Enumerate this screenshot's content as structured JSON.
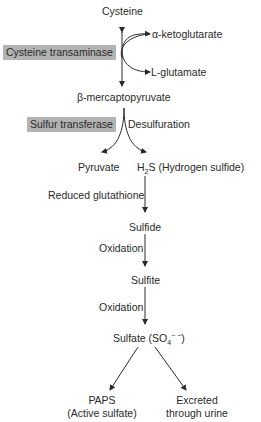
{
  "diagram": {
    "nodes": {
      "cysteine": "Cysteine",
      "alpha_ketoglutarate": "α-ketoglutarate",
      "l_glutamate": "L-glutamate",
      "beta_mercaptopyruvate": "β-mercaptopyruvate",
      "pyruvate": "Pyruvate",
      "h2s_prefix": "H",
      "h2s_sub": "2",
      "h2s_suffix": "S (Hydrogen sulfide)",
      "sulfide": "Sulfide",
      "sulfite": "Sulfite",
      "sulfate_prefix": "Sulfate (SO",
      "sulfate_sub": "4",
      "sulfate_sup": "− −",
      "sulfate_suffix": ")",
      "paps_line1": "PAPS",
      "paps_line2": "(Active sulfate)",
      "excreted_line1": "Excreted",
      "excreted_line2": "through urine"
    },
    "enzymes": {
      "cysteine_transaminase": "Cysteine transaminase",
      "sulfur_transferase": "Sulfur transferase"
    },
    "edge_labels": {
      "desulfuration": "Desulfuration",
      "reduced_glutathione": "Reduced glutathione",
      "oxidation_1": "Oxidation",
      "oxidation_2": "Oxidation"
    },
    "colors": {
      "enzyme_box": "#b3b3b3",
      "text": "#2a2a2a",
      "arrow": "#2a2a2a"
    }
  }
}
